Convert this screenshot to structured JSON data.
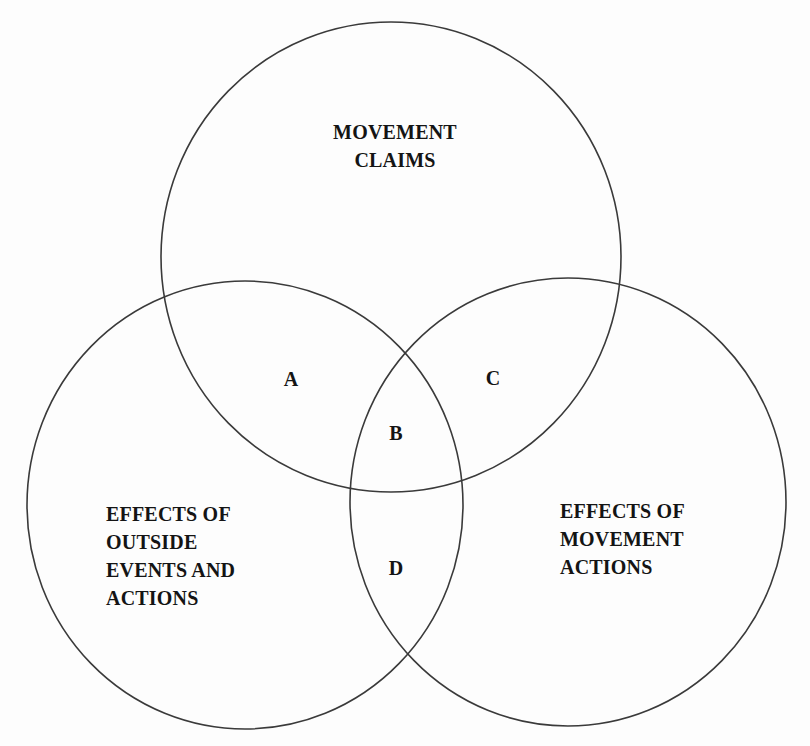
{
  "diagram": {
    "type": "venn",
    "circles": [
      {
        "id": "movement-claims",
        "label_lines": [
          "MOVEMENT",
          "CLAIMS"
        ],
        "cx": 391,
        "cy": 257,
        "rx": 230,
        "ry": 235
      },
      {
        "id": "effects-outside",
        "label_lines": [
          "EFFECTS OF",
          "OUTSIDE",
          "EVENTS AND",
          "ACTIONS"
        ],
        "cx": 245,
        "cy": 505,
        "rx": 218,
        "ry": 224
      },
      {
        "id": "effects-movement",
        "label_lines": [
          "EFFECTS OF",
          "MOVEMENT",
          "ACTIONS"
        ],
        "cx": 568,
        "cy": 502,
        "rx": 218,
        "ry": 224
      }
    ],
    "regions": [
      {
        "label": "A",
        "x": 291,
        "y": 379
      },
      {
        "label": "B",
        "x": 396,
        "y": 433
      },
      {
        "label": "C",
        "x": 493,
        "y": 378
      },
      {
        "label": "D",
        "x": 396,
        "y": 568
      }
    ],
    "stroke_color": "#3a3a3a",
    "text_color": "#141414",
    "background": "#fdfdfd"
  }
}
